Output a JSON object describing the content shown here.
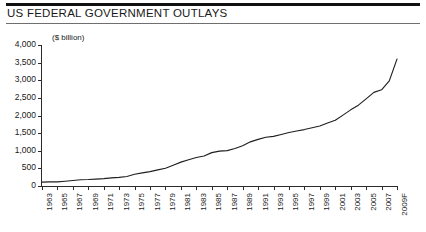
{
  "header": {
    "title": "US FEDERAL GOVERNMENT OUTLAYS"
  },
  "chart_data": {
    "type": "line",
    "title": "US FEDERAL GOVERNMENT OUTLAYS",
    "subtitle": "",
    "unit_label": "($ billion)",
    "xlabel": "",
    "ylabel": "",
    "ylim": [
      0,
      4000
    ],
    "ytick_values": [
      0,
      500,
      1000,
      1500,
      2000,
      2500,
      3000,
      3500,
      4000
    ],
    "ytick_labels": [
      "0",
      "500",
      "1,000",
      "1,500",
      "2,000",
      "2,500",
      "3,000",
      "3,500",
      "4,000"
    ],
    "grid": false,
    "legend": "none",
    "xtick_labels": [
      "1963",
      "1965",
      "1967",
      "1969",
      "1971",
      "1973",
      "1975",
      "1977",
      "1979",
      "1981",
      "1983",
      "1985",
      "1987",
      "1989",
      "1991",
      "1993",
      "1995",
      "1997",
      "1999",
      "2001",
      "2003",
      "2005",
      "2007",
      "2009F"
    ],
    "series": [
      {
        "name": "Federal outlays",
        "color": "#231f20",
        "x": [
          1963,
          1964,
          1965,
          1966,
          1967,
          1968,
          1969,
          1970,
          1971,
          1972,
          1973,
          1974,
          1975,
          1976,
          1977,
          1978,
          1979,
          1980,
          1981,
          1982,
          1983,
          1984,
          1985,
          1986,
          1987,
          1988,
          1989,
          1990,
          1991,
          1992,
          1993,
          1994,
          1995,
          1996,
          1997,
          1998,
          1999,
          2000,
          2001,
          2002,
          2003,
          2004,
          2005,
          2006,
          2007,
          2008,
          2009
        ],
        "values": [
          111,
          119,
          118,
          135,
          157,
          178,
          184,
          196,
          210,
          231,
          246,
          269,
          332,
          372,
          409,
          459,
          504,
          591,
          678,
          746,
          808,
          852,
          946,
          990,
          1004,
          1064,
          1143,
          1253,
          1324,
          1382,
          1409,
          1462,
          1516,
          1561,
          1601,
          1653,
          1702,
          1789,
          1863,
          2011,
          2160,
          2293,
          2472,
          2655,
          2729,
          2983,
          3600
        ]
      }
    ]
  }
}
